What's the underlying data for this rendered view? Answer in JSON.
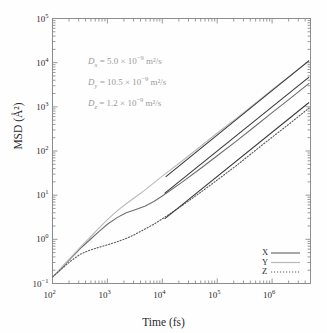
{
  "chart_data": {
    "type": "line",
    "title": "",
    "xlabel": "Time (fs)",
    "ylabel": "MSD (Å²)",
    "xscale": "log",
    "yscale": "log",
    "xlim": [
      100,
      5000000
    ],
    "ylim": [
      0.1,
      100000
    ],
    "xticks": [
      "10²",
      "10³",
      "10⁴",
      "10⁵",
      "10⁶"
    ],
    "xtick_values": [
      100,
      1000,
      10000,
      100000,
      1000000
    ],
    "yticks": [
      "10⁻¹",
      "10⁰",
      "10¹",
      "10²",
      "10³",
      "10⁴",
      "10⁵"
    ],
    "ytick_values": [
      0.1,
      1,
      10,
      100,
      1000,
      10000,
      100000
    ],
    "grid": false,
    "legend_position": "bottom-right",
    "series": [
      {
        "name": "X",
        "style": "solid",
        "color": "#6e6e6e",
        "x": [
          100,
          150,
          220,
          320,
          480,
          700,
          1000,
          1500,
          2200,
          3200,
          4800,
          7000,
          10000,
          22000,
          47000,
          100000,
          220000,
          470000,
          1000000,
          2200000,
          4700000
        ],
        "y": [
          0.14,
          0.23,
          0.38,
          0.62,
          0.98,
          1.5,
          2.2,
          3.1,
          4.0,
          4.7,
          5.6,
          7.2,
          9.6,
          19,
          38,
          78,
          165,
          350,
          740,
          1600,
          3400
        ]
      },
      {
        "name": "Y",
        "style": "solid",
        "color": "#b9b9b9",
        "x": [
          100,
          150,
          220,
          320,
          480,
          700,
          1000,
          1500,
          2200,
          3200,
          4800,
          7000,
          10000,
          22000,
          47000,
          100000,
          220000,
          470000,
          1000000,
          2200000,
          4700000
        ],
        "y": [
          0.14,
          0.24,
          0.4,
          0.66,
          1.1,
          1.8,
          2.8,
          4.4,
          6.4,
          9.0,
          13.0,
          19.0,
          27.0,
          57,
          120,
          255,
          540,
          1150,
          2450,
          5200,
          11000
        ]
      },
      {
        "name": "Z",
        "style": "dotted",
        "color": "#5a5a5a",
        "x": [
          100,
          150,
          220,
          320,
          480,
          700,
          1000,
          1500,
          2200,
          3200,
          4800,
          7000,
          10000,
          22000,
          47000,
          100000,
          220000,
          470000,
          1000000,
          2200000,
          4700000
        ],
        "y": [
          0.14,
          0.22,
          0.33,
          0.46,
          0.57,
          0.66,
          0.75,
          0.88,
          1.05,
          1.3,
          1.7,
          2.2,
          2.9,
          5.6,
          11.0,
          22.0,
          46.0,
          98.0,
          205,
          440,
          940
        ]
      }
    ],
    "fit_lines": [
      {
        "name": "fit-x",
        "color": "#3a3a3a",
        "x0": 11000,
        "y0": 11.0,
        "x1": 4700000,
        "y1": 4700.0
      },
      {
        "name": "fit-y",
        "color": "#3a3a3a",
        "x0": 11500,
        "y0": 26.0,
        "x1": 4700000,
        "y1": 11100.0
      },
      {
        "name": "fit-z",
        "color": "#3a3a3a",
        "x0": 11000,
        "y0": 2.9,
        "x1": 4700000,
        "y1": 1250.0
      }
    ],
    "annotations": [
      {
        "symbol": "D",
        "sub": "x",
        "eq": "=",
        "value": "5.0",
        "times": "×",
        "base": "10",
        "exp": "−9",
        "unit": "m²/s"
      },
      {
        "symbol": "D",
        "sub": "y",
        "eq": "=",
        "value": "10.5",
        "times": "×",
        "base": "10",
        "exp": "−9",
        "unit": "m²/s"
      },
      {
        "symbol": "D",
        "sub": "z",
        "eq": "=",
        "value": "1.2",
        "times": "×",
        "base": "10",
        "exp": "−9",
        "unit": "m²/s"
      }
    ],
    "annotation_color": "#9a9a9a"
  }
}
